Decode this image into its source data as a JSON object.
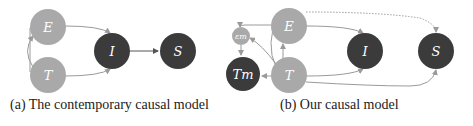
{
  "colors": {
    "light_node": "#a9a9a9",
    "dark_node": "#3b3b3b",
    "edge": "#9a9a9a",
    "dark_edge": "#555555",
    "label": "#ffffff"
  },
  "diagram_a": {
    "caption": "(a) The contemporary causal model",
    "nodes": [
      {
        "id": "E",
        "label": "E",
        "style": "light"
      },
      {
        "id": "T",
        "label": "T",
        "style": "light"
      },
      {
        "id": "I",
        "label": "I",
        "style": "dark"
      },
      {
        "id": "S",
        "label": "S",
        "style": "dark"
      }
    ],
    "edges": [
      [
        "E",
        "I"
      ],
      [
        "T",
        "I"
      ],
      [
        "I",
        "S"
      ],
      [
        "T",
        "E"
      ]
    ]
  },
  "diagram_b": {
    "caption": "(b) Our causal model",
    "nodes": [
      {
        "id": "eps_m",
        "label": "εm",
        "style": "light"
      },
      {
        "id": "T_m",
        "label": "Tm",
        "style": "dark"
      },
      {
        "id": "E",
        "label": "E",
        "style": "light"
      },
      {
        "id": "T",
        "label": "T",
        "style": "light"
      },
      {
        "id": "I",
        "label": "I",
        "style": "dark"
      },
      {
        "id": "S",
        "label": "S",
        "style": "dark"
      }
    ],
    "edges": [
      [
        "E",
        "eps_m"
      ],
      [
        "T",
        "eps_m"
      ],
      [
        "eps_m",
        "T_m"
      ],
      [
        "T",
        "T_m"
      ],
      [
        "T",
        "E"
      ],
      [
        "E",
        "I"
      ],
      [
        "T",
        "I"
      ],
      [
        "T",
        "S"
      ],
      [
        "E",
        "S",
        "dotted"
      ]
    ]
  }
}
